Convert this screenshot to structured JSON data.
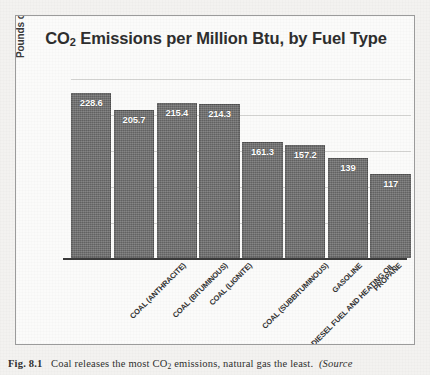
{
  "chart_data": {
    "type": "bar",
    "title": "CO2 Emissions per Million Btu, by Fuel Type",
    "title_main": "CO",
    "title_sub": "2",
    "title_rest": " Emissions per Million Btu, by Fuel Type",
    "xlabel": "",
    "ylabel": "Pounds of CO2",
    "ylabel_main": "Pounds of CO",
    "ylabel_sub": "2",
    "ylim": [
      0,
      250
    ],
    "grid": true,
    "gridline_values": [
      50,
      100,
      150,
      200,
      250
    ],
    "legend": "none",
    "categories": [
      "COAL (ANTHRACITE)",
      "COAL (BITUMINOUS)",
      "COAL (LIGNITE)",
      "COAL (SUBBITUMINOUS)",
      "DIESEL FUEL AND HEATING OIL",
      "GASOLINE",
      "PROPANE",
      "NATURAL GAS"
    ],
    "values": [
      228.6,
      205.7,
      215.4,
      214.3,
      161.3,
      157.2,
      139,
      117
    ],
    "value_labels": [
      "228.6",
      "205.7",
      "215.4",
      "214.3",
      "161.3",
      "157.2",
      "139",
      "117"
    ],
    "bar_color": "#6e6e6e",
    "label_color": "#ffffff",
    "axis_color": "#3a3a3a",
    "grid_color": "#d3d3d1"
  },
  "caption": {
    "figure_number": "Fig. 8.1",
    "text_main": "Coal releases the most CO",
    "text_sub": "2",
    "text_rest": " emissions, natural gas the least.",
    "source_label": "(Source"
  }
}
